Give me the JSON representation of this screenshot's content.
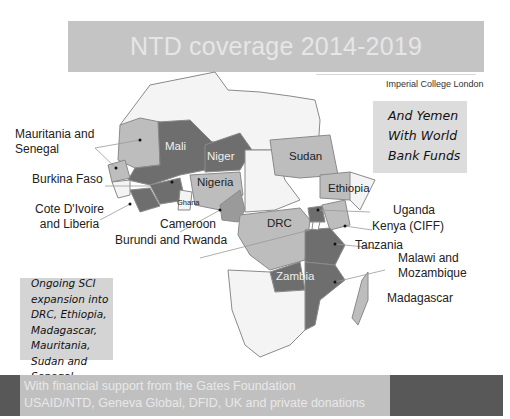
{
  "header": {
    "title": "NTD coverage 2014-2019",
    "credit": "Imperial College London"
  },
  "callouts": {
    "yemen": "And Yemen\nWith World\nBank Funds",
    "sci_expansion": "Ongoing SCI\nexpansion into\nDRC, Ethiopia,\nMadagascar,\nMauritania,\nSudan and\nSenegal"
  },
  "external_labels": {
    "mauritania_senegal": "Mauritania and\nSenegal",
    "burkina_faso": "Burkina Faso",
    "cote_divoire_liberia": "Cote D'Ivoire\nand Liberia",
    "cameroon": "Cameroon",
    "burundi_rwanda": "Burundi and Rwanda",
    "uganda": "Uganda",
    "kenya": "Kenya (CIFF)",
    "tanzania": "Tanzania",
    "malawi_mozambique": "Malawi and\nMozambique",
    "madagascar": "Madagascar"
  },
  "map_labels": {
    "mali": "Mali",
    "niger": "Niger",
    "nigeria": "Nigeria",
    "ghana": "Ghana",
    "sudan": "Sudan",
    "ethiopia": "Ethiopia",
    "drc": "DRC",
    "zambia": "Zambia"
  },
  "legend_colors": {
    "active_dark": "#6e6e6e",
    "expansion_light": "#bdbdbd",
    "not_covered": "#f4f4f4",
    "border": "#8a8a8a"
  },
  "footer": {
    "text": "With financial support from the Gates Foundation\nUSAID/NTD, Geneva Global, DFID, UK and private donations"
  }
}
